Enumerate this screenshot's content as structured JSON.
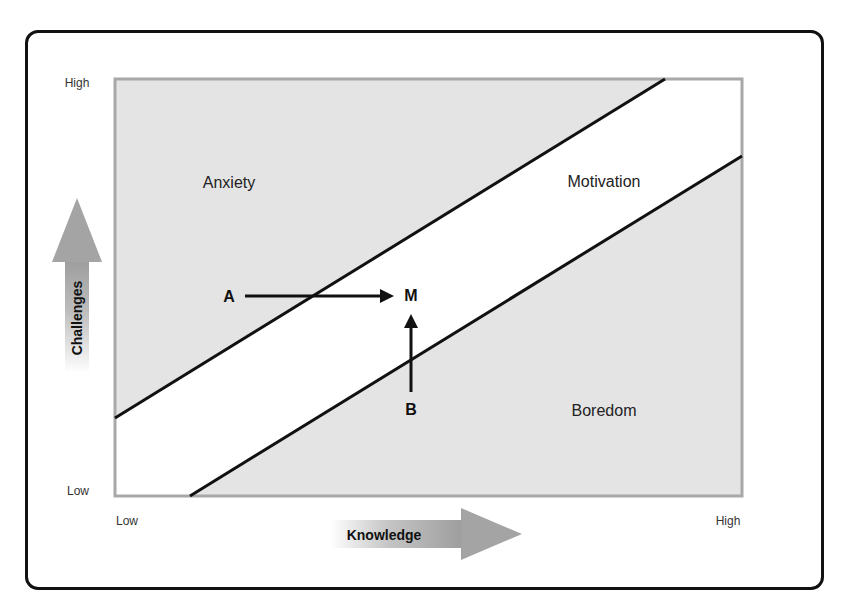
{
  "diagram": {
    "type": "flow-channel",
    "y_axis": {
      "title": "Challenges",
      "low_label": "Low",
      "high_label": "High"
    },
    "x_axis": {
      "title": "Knowledge",
      "low_label": "Low",
      "high_label": "High"
    },
    "regions": {
      "anxiety": "Anxiety",
      "motivation": "Motivation",
      "boredom": "Boredom"
    },
    "points": {
      "a": "A",
      "m": "M",
      "b": "B"
    },
    "transitions": [
      {
        "from": "A",
        "to": "M",
        "direction": "right"
      },
      {
        "from": "B",
        "to": "M",
        "direction": "up"
      }
    ],
    "colors": {
      "shaded_region": "#e4e4e4",
      "channel": "#ffffff",
      "plot_border": "#a8a8a8",
      "lines": "#111111",
      "axis_arrow": "#a0a0a0"
    }
  }
}
